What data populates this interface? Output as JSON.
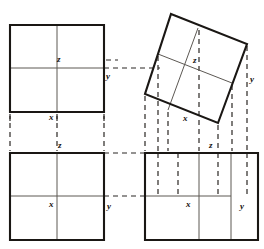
{
  "figure": {
    "stroke_colors": {
      "outline": "#1a1714",
      "inner": "#5c5853",
      "dashed": "#2b2724",
      "background": "#ffffff"
    },
    "stroke_widths": {
      "outline": 2.1,
      "inner": 1.0,
      "dashed": 1.2
    },
    "dash_pattern": "5 4"
  },
  "labels": [
    {
      "id": "tl-z",
      "text": "z",
      "x": 57,
      "y": 55,
      "panel": "top-left"
    },
    {
      "id": "tl-y",
      "text": "y",
      "x": 106,
      "y": 72,
      "panel": "top-left"
    },
    {
      "id": "tl-x",
      "text": "x",
      "x": 49,
      "y": 113,
      "panel": "top-left"
    },
    {
      "id": "tr-z",
      "text": "z",
      "x": 193,
      "y": 56,
      "panel": "top-right"
    },
    {
      "id": "tr-y",
      "text": "y",
      "x": 250,
      "y": 75,
      "panel": "top-right"
    },
    {
      "id": "tr-x",
      "text": "x",
      "x": 183,
      "y": 114,
      "panel": "top-right"
    },
    {
      "id": "bl-z",
      "text": "z",
      "x": 58,
      "y": 141,
      "panel": "bottom-left"
    },
    {
      "id": "bl-x",
      "text": "x",
      "x": 49,
      "y": 200,
      "panel": "bottom-left"
    },
    {
      "id": "bl-y",
      "text": "y",
      "x": 107,
      "y": 202,
      "panel": "bottom-left"
    },
    {
      "id": "br-z",
      "text": "z",
      "x": 209,
      "y": 141,
      "panel": "bottom-right"
    },
    {
      "id": "br-x",
      "text": "x",
      "x": 186,
      "y": 200,
      "panel": "bottom-right"
    },
    {
      "id": "br-y",
      "text": "y",
      "x": 240,
      "y": 202,
      "panel": "bottom-right"
    }
  ],
  "panels": {
    "top_left": {
      "name": "upright-square-top-left",
      "outline": [
        [
          10,
          25
        ],
        [
          104,
          25
        ],
        [
          104,
          112
        ],
        [
          10,
          112
        ]
      ],
      "inner_lines": [
        [
          [
            57,
            25
          ],
          [
            57,
            112
          ]
        ],
        [
          [
            10,
            68
          ],
          [
            104,
            68
          ]
        ]
      ]
    },
    "top_right": {
      "name": "rotated-square-top-right",
      "outline": [
        [
          171,
          14
        ],
        [
          247,
          44
        ],
        [
          218,
          123
        ],
        [
          145,
          94
        ]
      ],
      "inner_lines": [
        [
          [
            158,
            54
          ],
          [
            232,
            83
          ]
        ],
        [
          [
            198,
            28
          ],
          [
            168,
            110
          ]
        ]
      ]
    },
    "bottom_left": {
      "name": "upright-square-bottom-left",
      "outline": [
        [
          10,
          153
        ],
        [
          104,
          153
        ],
        [
          104,
          240
        ],
        [
          10,
          240
        ]
      ],
      "inner_lines": [
        [
          [
            57,
            153
          ],
          [
            57,
            240
          ]
        ],
        [
          [
            10,
            196
          ],
          [
            104,
            196
          ]
        ]
      ]
    },
    "bottom_right": {
      "name": "rectangle-bottom-right",
      "outline": [
        [
          145,
          153
        ],
        [
          258,
          153
        ],
        [
          258,
          240
        ],
        [
          145,
          240
        ]
      ],
      "inner_lines": [
        [
          [
            199,
            153
          ],
          [
            199,
            240
          ]
        ],
        [
          [
            231,
            153
          ],
          [
            231,
            240
          ]
        ],
        [
          [
            145,
            196
          ],
          [
            231,
            196
          ]
        ]
      ]
    }
  },
  "projection_lines": {
    "horizontal": [
      {
        "id": "h-tl-to-tr",
        "from": [
          104,
          68
        ],
        "to": [
          160,
          68
        ]
      },
      {
        "id": "h-bl-to-br",
        "from": [
          104,
          153
        ],
        "to": [
          145,
          153
        ]
      },
      {
        "id": "h-bl-mid-to-br",
        "from": [
          104,
          196
        ],
        "to": [
          145,
          196
        ]
      }
    ],
    "vertical": [
      {
        "id": "v-tl-left",
        "from": [
          10,
          114
        ],
        "to": [
          10,
          151
        ]
      },
      {
        "id": "v-tl-mid",
        "from": [
          57,
          114
        ],
        "to": [
          57,
          151
        ]
      },
      {
        "id": "v-tl-right",
        "from": [
          104,
          114
        ],
        "to": [
          104,
          151
        ]
      },
      {
        "id": "v-tr-a",
        "from": [
          145,
          96
        ],
        "to": [
          145,
          151
        ]
      },
      {
        "id": "v-tr-b",
        "from": [
          158,
          56
        ],
        "to": [
          158,
          151
        ]
      },
      {
        "id": "v-tr-c",
        "from": [
          168,
          112
        ],
        "to": [
          168,
          151
        ]
      },
      {
        "id": "v-tr-d",
        "from": [
          199,
          30
        ],
        "to": [
          199,
          151
        ]
      },
      {
        "id": "v-tr-e",
        "from": [
          218,
          125
        ],
        "to": [
          218,
          151
        ]
      },
      {
        "id": "v-tr-f",
        "from": [
          232,
          85
        ],
        "to": [
          232,
          151
        ]
      },
      {
        "id": "v-tr-g",
        "from": [
          247,
          46
        ],
        "to": [
          247,
          151
        ]
      },
      {
        "id": "v-br-a",
        "from": [
          158,
          153
        ],
        "to": [
          158,
          196
        ]
      },
      {
        "id": "v-br-b",
        "from": [
          178,
          153
        ],
        "to": [
          178,
          196
        ]
      },
      {
        "id": "v-br-c",
        "from": [
          218,
          153
        ],
        "to": [
          218,
          196
        ]
      },
      {
        "id": "v-br-d",
        "from": [
          247,
          153
        ],
        "to": [
          247,
          196
        ]
      }
    ],
    "ticks": [
      {
        "id": "tick-tl-x-left",
        "from": [
          10,
          116
        ],
        "to": [
          10,
          124
        ]
      },
      {
        "id": "tick-tl-x-mid",
        "from": [
          57,
          116
        ],
        "to": [
          57,
          124
        ]
      },
      {
        "id": "tick-tl-x-right",
        "from": [
          104,
          116
        ],
        "to": [
          104,
          124
        ]
      },
      {
        "id": "tick-tl-y",
        "from": [
          106,
          60
        ],
        "to": [
          118,
          60
        ]
      }
    ]
  }
}
